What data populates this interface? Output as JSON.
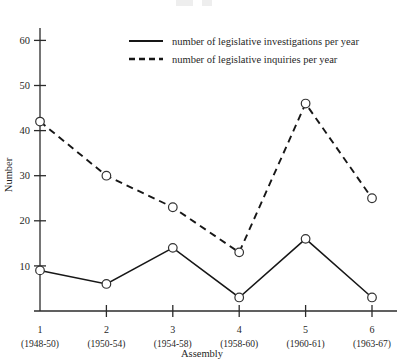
{
  "chart_data": {
    "type": "line",
    "title": "",
    "xlabel": "Assembly",
    "ylabel": "Number",
    "categories": [
      "1",
      "2",
      "3",
      "4",
      "5",
      "6"
    ],
    "category_sublabels": [
      "(1948-50)",
      "(1950-54)",
      "(1954-58)",
      "(1958-60)",
      "(1960-61)",
      "(1963-67)"
    ],
    "ylim": [
      0,
      62
    ],
    "yticks": [
      10,
      20,
      30,
      40,
      50,
      60
    ],
    "ytick_labels": [
      "10",
      "20",
      "30",
      "40",
      "50",
      "60"
    ],
    "grid": false,
    "legend_position": "top-right-inside",
    "marker": "open-circle",
    "series": [
      {
        "name": "number of legislative investigations per year",
        "style": "solid",
        "color": "#171717",
        "values": [
          9,
          6,
          14,
          3,
          16,
          3
        ]
      },
      {
        "name": "number of legislative inquiries per year",
        "style": "dashed",
        "color": "#171717",
        "values": [
          42,
          30,
          23,
          13,
          46,
          25
        ]
      }
    ]
  },
  "axes": {
    "y_title": "Number",
    "x_title": "Assembly"
  },
  "legend": {
    "entries": [
      {
        "label": "number of legislative investigations per year",
        "style": "solid"
      },
      {
        "label": "number of legislative inquiries per year",
        "style": "dashed"
      }
    ]
  }
}
